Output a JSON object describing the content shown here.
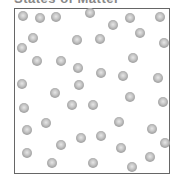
{
  "diagram": {
    "title": "States of Matter",
    "container": {
      "label": "gas-container",
      "border_color": "#666666"
    },
    "particle_color": "#a0a0a0",
    "particles": [
      [
        23,
        16
      ],
      [
        40,
        18
      ],
      [
        56,
        17
      ],
      [
        90,
        13
      ],
      [
        130,
        18
      ],
      [
        160,
        17
      ],
      [
        113,
        25
      ],
      [
        140,
        33
      ],
      [
        77,
        40
      ],
      [
        100,
        39
      ],
      [
        33,
        38
      ],
      [
        22,
        48
      ],
      [
        164,
        43
      ],
      [
        37,
        61
      ],
      [
        61,
        61
      ],
      [
        133,
        58
      ],
      [
        78,
        68
      ],
      [
        101,
        73
      ],
      [
        123,
        76
      ],
      [
        158,
        78
      ],
      [
        22,
        84
      ],
      [
        79,
        85
      ],
      [
        55,
        93
      ],
      [
        130,
        97
      ],
      [
        163,
        102
      ],
      [
        24,
        108
      ],
      [
        72,
        105
      ],
      [
        93,
        105
      ],
      [
        46,
        123
      ],
      [
        27,
        130
      ],
      [
        119,
        122
      ],
      [
        81,
        138
      ],
      [
        101,
        136
      ],
      [
        152,
        129
      ],
      [
        61,
        145
      ],
      [
        165,
        143
      ],
      [
        121,
        148
      ],
      [
        27,
        153
      ],
      [
        150,
        157
      ],
      [
        52,
        163
      ],
      [
        93,
        163
      ],
      [
        132,
        167
      ]
    ]
  }
}
